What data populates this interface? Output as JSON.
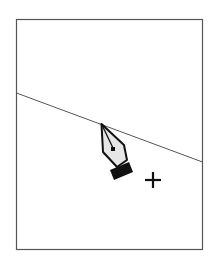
{
  "illustration": {
    "frame": {
      "x": 16,
      "y": 19,
      "width": 187,
      "height": 231,
      "stroke": "#555555"
    },
    "line": {
      "x1": 16,
      "y1": 93,
      "x2": 203,
      "y2": 162,
      "stroke": "#555555"
    },
    "pen_cursor": {
      "icon": "pen-tool-icon",
      "tip_x": 101,
      "tip_y": 124,
      "fill": "#e4e4e4",
      "stroke": "#111111"
    },
    "plus_cursor": {
      "icon": "plus-icon",
      "cx": 152,
      "cy": 180,
      "color": "#111111"
    }
  }
}
